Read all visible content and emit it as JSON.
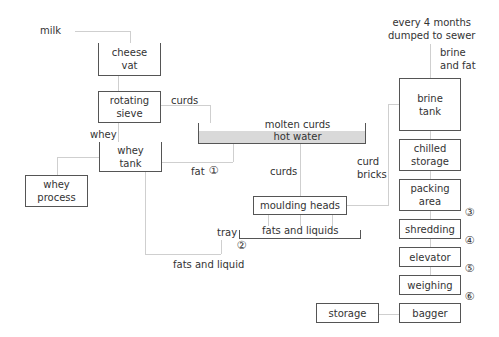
{
  "inputs": {
    "milk": "milk"
  },
  "nodes": {
    "cheese_vat": [
      "cheese",
      "vat"
    ],
    "rotating_sieve": [
      "rotating",
      "sieve"
    ],
    "whey_tank": [
      "whey",
      "tank"
    ],
    "whey_process": [
      "whey",
      "process"
    ],
    "molten_vat_top": "molten curds",
    "molten_vat_bottom": "hot water",
    "moulding_heads": "moulding heads",
    "tray_content": "fats and liquids",
    "brine_tank": [
      "brine",
      "tank"
    ],
    "chilled_storage": [
      "chilled",
      "storage"
    ],
    "packing_area": [
      "packing",
      "area"
    ],
    "shredding": "shredding",
    "elevator": "elevator",
    "weighing": "weighing",
    "bagger": "bagger",
    "storage": "storage"
  },
  "labels": {
    "curds_from_sieve": "curds",
    "whey": "whey",
    "fat": "fat",
    "curds_down": "curds",
    "curd_bricks": [
      "curd",
      "bricks"
    ],
    "tray": "tray",
    "fats_and_liquid": "fats and liquid",
    "brine_dump": [
      "every 4 months",
      "dumped to sewer"
    ],
    "brine_and_fat": [
      "brine",
      "and fat"
    ]
  },
  "markers": [
    "①",
    "②",
    "③",
    "④",
    "⑤",
    "⑥"
  ]
}
